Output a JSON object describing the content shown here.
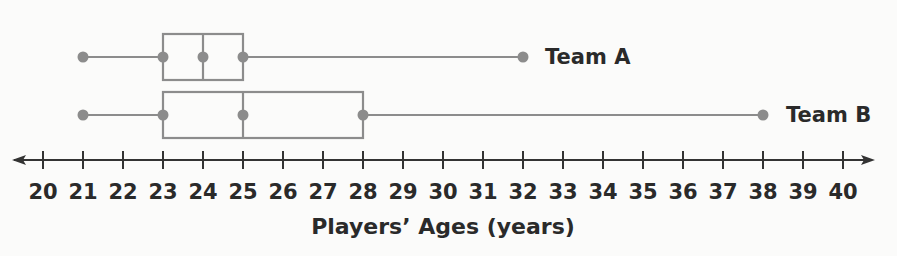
{
  "chart_data": {
    "type": "boxplot",
    "title": "",
    "xlabel": "Players’ Ages (years)",
    "ylabel": "",
    "xlim": [
      20,
      40
    ],
    "ticks": [
      20,
      21,
      22,
      23,
      24,
      25,
      26,
      27,
      28,
      29,
      30,
      31,
      32,
      33,
      34,
      35,
      36,
      37,
      38,
      39,
      40
    ],
    "tick_labels": [
      "20",
      "21",
      "22",
      "23",
      "24",
      "25",
      "26",
      "27",
      "28",
      "29",
      "30",
      "31",
      "32",
      "33",
      "34",
      "35",
      "36",
      "37",
      "38",
      "39",
      "40"
    ],
    "grid": false,
    "legend": "labels at right end of each box plot",
    "series": [
      {
        "name": "Team A",
        "min": 21,
        "q1": 23,
        "median": 24,
        "q3": 25,
        "max": 32
      },
      {
        "name": "Team B",
        "min": 21,
        "q1": 23,
        "median": 25,
        "q3": 28,
        "max": 38
      }
    ]
  },
  "colors": {
    "plot_gray": "#8c8c8c",
    "text": "#2a2a2a",
    "axis": "#333333",
    "background": "#fbfbfa"
  },
  "labels": {
    "team_a": "Team A",
    "team_b": "Team B",
    "axis_title": "Players’ Ages (years)"
  }
}
